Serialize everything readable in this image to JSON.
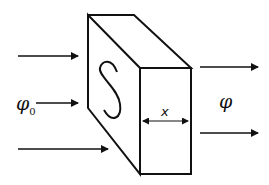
{
  "diagram": {
    "incident_flux_label": "φ",
    "incident_flux_subscript": "0",
    "transmitted_flux_label": "φ",
    "thickness_label": "x",
    "face_label": "S",
    "colors": {
      "stroke": "#111111",
      "background": "#ffffff"
    }
  }
}
